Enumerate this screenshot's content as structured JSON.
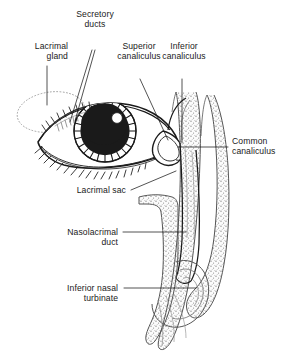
{
  "figure": {
    "background_color": "#ffffff",
    "ink_color": "#1a1a1a",
    "bone_stipple_color": "#6f6f6f",
    "tissue_tint": "#f4f4f4"
  },
  "labels": {
    "secretory_ducts": "Secretory\nducts",
    "lacrimal_gland": "Lacrimal\ngland",
    "superior_canaliculus": "Superior\ncanaliculus",
    "inferior_canaliculus": "Inferior\ncanaliculus",
    "common_canaliculus": "Common\ncanaliculus",
    "lacrimal_sac": "Lacrimal sac",
    "nasolacrimal_duct": "Nasolacrimal\nduct",
    "inferior_nasal_turbinate": "Inferior nasal\nturbinate"
  },
  "structures": {
    "eye": "eye-globe",
    "iris": "iris",
    "pupil": "pupil",
    "catchlight": "corneal-highlight",
    "upper_lashes": "upper-eyelashes",
    "lower_lashes": "lower-eyelashes",
    "gland": "lacrimal-gland-outline",
    "ducts": "secretory-duct-lines",
    "sac": "lacrimal-sac",
    "duct": "nasolacrimal-duct",
    "turbinate": "inferior-nasal-turbinate",
    "bone": "nasal-bone-section"
  }
}
